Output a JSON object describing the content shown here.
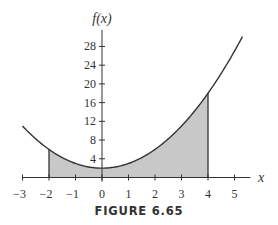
{
  "caption": "FIGURE 6.65",
  "chart_data": {
    "type": "line",
    "title": "",
    "function": "f(x) = x^2 + 2",
    "xlabel": "x",
    "ylabel": "f(x)",
    "xlim": [
      -3,
      5.5
    ],
    "ylim": [
      0,
      30
    ],
    "x_ticks": [
      -3,
      -2,
      -1,
      0,
      1,
      2,
      3,
      4,
      5
    ],
    "y_ticks": [
      4,
      8,
      12,
      16,
      20,
      24,
      28
    ],
    "shaded_region": {
      "from": -2,
      "to": 4,
      "color": "#c8c8c8"
    },
    "series": [
      {
        "name": "f(x)",
        "x": [
          -3,
          -2,
          -1,
          0,
          1,
          2,
          3,
          4,
          5,
          5.3
        ],
        "values": [
          11,
          6,
          3,
          2,
          3,
          6,
          11,
          18,
          27,
          30.1
        ]
      }
    ],
    "grid": false,
    "legend": null
  }
}
